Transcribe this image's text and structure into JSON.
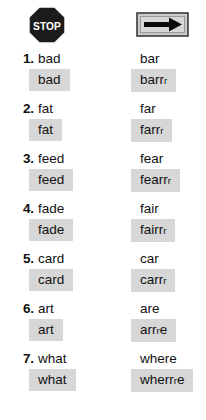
{
  "header": {
    "left_icon": {
      "name": "stop-sign-icon",
      "label": "STOP",
      "shape": "octagon",
      "fill": "#1c1c1c",
      "text_color": "#ffffff"
    },
    "right_icon": {
      "name": "right-arrow-sign-icon",
      "shape": "rectangle",
      "fill": "#c9c9c9",
      "border_color": "#3b3b3b",
      "arrow_color": "#0b0b0b"
    }
  },
  "highlight_color": "#d7d7d7",
  "items": [
    {
      "number": "1.",
      "left_plain": "bad",
      "left_highlight": "bad",
      "right_plain": "bar",
      "right_highlight_main": "barr",
      "right_highlight_small": "r",
      "right_highlight_tail": ""
    },
    {
      "number": "2.",
      "left_plain": "fat",
      "left_highlight": "fat",
      "right_plain": "far",
      "right_highlight_main": "farr",
      "right_highlight_small": "r",
      "right_highlight_tail": ""
    },
    {
      "number": "3.",
      "left_plain": "feed",
      "left_highlight": "feed",
      "right_plain": "fear",
      "right_highlight_main": "fearr",
      "right_highlight_small": "r",
      "right_highlight_tail": ""
    },
    {
      "number": "4.",
      "left_plain": "fade",
      "left_highlight": "fade",
      "right_plain": "fair",
      "right_highlight_main": "fairr",
      "right_highlight_small": "r",
      "right_highlight_tail": ""
    },
    {
      "number": "5.",
      "left_plain": "card",
      "left_highlight": "card",
      "right_plain": "car",
      "right_highlight_main": "carr",
      "right_highlight_small": "r",
      "right_highlight_tail": ""
    },
    {
      "number": "6.",
      "left_plain": "art",
      "left_highlight": "art",
      "right_plain": "are",
      "right_highlight_main": "arr",
      "right_highlight_small": "r",
      "right_highlight_tail": "e"
    },
    {
      "number": "7.",
      "left_plain": "what",
      "left_highlight": "what",
      "right_plain": "where",
      "right_highlight_main": "wherr",
      "right_highlight_small": "r",
      "right_highlight_tail": "e"
    }
  ]
}
